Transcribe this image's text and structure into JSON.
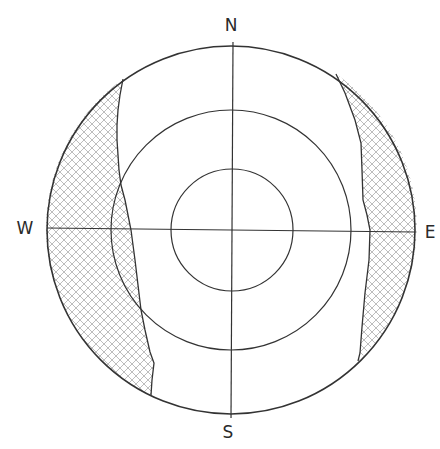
{
  "diagram": {
    "type": "sun-path-shading-mask",
    "labels": {
      "north": "N",
      "south": "S",
      "east": "E",
      "west": "W"
    },
    "rings": {
      "count": 3,
      "outer_radius_px": 184,
      "middle_radius_px": 120,
      "inner_radius_px": 61
    },
    "shaded_regions": [
      {
        "name": "west-shaded-region",
        "side": "west"
      },
      {
        "name": "east-shaded-region",
        "side": "east"
      }
    ],
    "colors": {
      "line": "#333333",
      "hatch": "#b5b5b5",
      "background": "#ffffff"
    }
  }
}
